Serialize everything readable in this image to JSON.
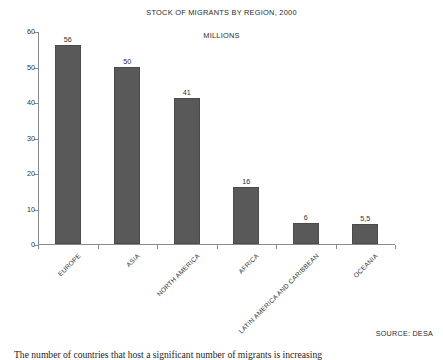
{
  "chart_data": {
    "type": "bar",
    "title": "STOCK OF MIGRANTS BY REGION, 2000",
    "subtitle": "MILLIONS",
    "xlabel": "",
    "ylabel": "",
    "ylim": [
      0,
      60
    ],
    "yticks": [
      0,
      10,
      20,
      30,
      40,
      50,
      60
    ],
    "ytick_labels": [
      "0",
      "10",
      "20",
      "30",
      "40",
      "50",
      "60"
    ],
    "grid": false,
    "legend": false,
    "bar_color": "#595959",
    "axis_color": "#8a8a8a",
    "categories": [
      "EUROPE",
      "ASIA",
      "NORTH AMERICA",
      "AFRICA",
      "LATIN AMERICA AND CARIBBEAN",
      "OCEANIA"
    ],
    "values": [
      56,
      50,
      41,
      16,
      6,
      5.5
    ],
    "value_labels": [
      "56",
      "50",
      "41",
      "16",
      "6",
      "5,5"
    ]
  },
  "source": {
    "note": "SOURCE: DESA"
  },
  "body": {
    "paragraph": "The number of countries that host a significant number of migrants is increasing"
  }
}
